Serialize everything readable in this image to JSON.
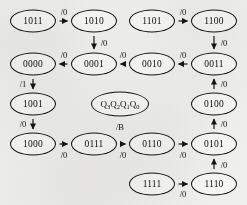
{
  "diagram": {
    "kind": "state-transition-diagram",
    "state_vector_label": "Q3Q2Q1Q0",
    "state_vector_parts": [
      "Q",
      "3",
      "Q",
      "2",
      "Q",
      "1",
      "Q",
      "0"
    ],
    "legend_output_label": "/B",
    "ink_color": "#141414",
    "background_color": "#f4f4f3",
    "node_fill": "#fbfbfa",
    "states": [
      {
        "id": "s1011",
        "label": "1011",
        "x": 33,
        "y": 21
      },
      {
        "id": "s1010",
        "label": "1010",
        "x": 94,
        "y": 21
      },
      {
        "id": "s1101",
        "label": "1101",
        "x": 152,
        "y": 21
      },
      {
        "id": "s1100",
        "label": "1100",
        "x": 214,
        "y": 21
      },
      {
        "id": "s0000",
        "label": "0000",
        "x": 33,
        "y": 64
      },
      {
        "id": "s0001",
        "label": "0001",
        "x": 94,
        "y": 64
      },
      {
        "id": "s0010",
        "label": "0010",
        "x": 152,
        "y": 64
      },
      {
        "id": "s0011",
        "label": "0011",
        "x": 214,
        "y": 64
      },
      {
        "id": "s1001",
        "label": "1001",
        "x": 33,
        "y": 104
      },
      {
        "id": "s0100",
        "label": "0100",
        "x": 214,
        "y": 104
      },
      {
        "id": "s1000",
        "label": "1000",
        "x": 33,
        "y": 144
      },
      {
        "id": "s0111",
        "label": "0111",
        "x": 94,
        "y": 144
      },
      {
        "id": "s0110",
        "label": "0110",
        "x": 152,
        "y": 144
      },
      {
        "id": "s0101",
        "label": "0101",
        "x": 214,
        "y": 144
      },
      {
        "id": "s1111",
        "label": "1111",
        "x": 152,
        "y": 184
      },
      {
        "id": "s1110",
        "label": "1110",
        "x": 214,
        "y": 184
      }
    ],
    "legend_state": {
      "id": "legend",
      "x": 120,
      "y": 104
    },
    "transitions": [
      {
        "id": "t1",
        "from": "1011",
        "to": "1010",
        "output": "/0",
        "direction": "right",
        "label_x": 64,
        "label_y": 12
      },
      {
        "id": "t2",
        "from": "1101",
        "to": "1100",
        "output": "/0",
        "direction": "right",
        "label_x": 183,
        "label_y": 12
      },
      {
        "id": "t3",
        "from": "1010",
        "to": "0001",
        "output": "/0",
        "direction": "down",
        "label_x": 104,
        "label_y": 43
      },
      {
        "id": "t4",
        "from": "1100",
        "to": "0011",
        "output": "/0",
        "direction": "down",
        "label_x": 224,
        "label_y": 43
      },
      {
        "id": "t5",
        "from": "0001",
        "to": "0000",
        "output": "/0",
        "direction": "left",
        "label_x": 64,
        "label_y": 55
      },
      {
        "id": "t6",
        "from": "0010",
        "to": "0001",
        "output": "/0",
        "direction": "left",
        "label_x": 123,
        "label_y": 55
      },
      {
        "id": "t7",
        "from": "0011",
        "to": "0010",
        "output": "/0",
        "direction": "left",
        "label_x": 183,
        "label_y": 55
      },
      {
        "id": "t8",
        "from": "0100",
        "to": "0011",
        "output": "/0",
        "direction": "up",
        "label_x": 224,
        "label_y": 84
      },
      {
        "id": "t9",
        "from": "0000",
        "to": "1001",
        "output": "/1",
        "direction": "down",
        "label_x": 23,
        "label_y": 84
      },
      {
        "id": "t10",
        "from": "0101",
        "to": "0100",
        "output": "/0",
        "direction": "up",
        "label_x": 224,
        "label_y": 124
      },
      {
        "id": "t11",
        "from": "1001",
        "to": "1000",
        "output": "/0",
        "direction": "down",
        "label_x": 23,
        "label_y": 124
      },
      {
        "id": "t12",
        "from": "1000",
        "to": "0111",
        "output": "/0",
        "direction": "right",
        "label_x": 64,
        "label_y": 155
      },
      {
        "id": "t13",
        "from": "0111",
        "to": "0110",
        "output": "/0",
        "direction": "right",
        "label_x": 123,
        "label_y": 155
      },
      {
        "id": "t14",
        "from": "0110",
        "to": "0101",
        "output": "/0",
        "direction": "right",
        "label_x": 183,
        "label_y": 155
      },
      {
        "id": "t15",
        "from": "1110",
        "to": "0101",
        "output": "/0",
        "direction": "up",
        "label_x": 224,
        "label_y": 165
      },
      {
        "id": "t16",
        "from": "1111",
        "to": "1110",
        "output": "/0",
        "direction": "right",
        "label_x": 183,
        "label_y": 194
      }
    ]
  }
}
